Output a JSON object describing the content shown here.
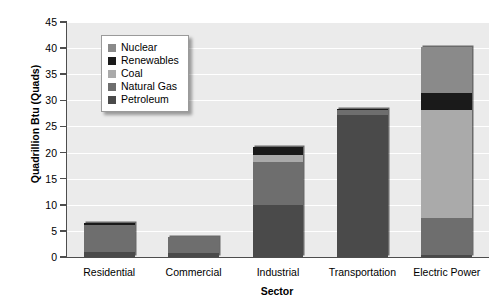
{
  "chart_data": {
    "type": "bar",
    "subtype": "stacked-bar",
    "title": "",
    "xlabel": "Sector",
    "ylabel": "Quadrillion Btu (Quads)",
    "ylim": [
      0,
      45
    ],
    "ytick_step": 5,
    "yticks": [
      0,
      5,
      10,
      15,
      20,
      25,
      30,
      35,
      40,
      45
    ],
    "grid": "horizontal",
    "legend_position": "upper-left-inside",
    "categories": [
      "Residential",
      "Commercial",
      "Industrial",
      "Transportation",
      "Electric Power"
    ],
    "series": [
      {
        "name": "Petroleum",
        "color": "#4a4a4a",
        "values": [
          1.0,
          0.7,
          9.9,
          27.2,
          0.4
        ]
      },
      {
        "name": "Natural Gas",
        "color": "#6e6e6e",
        "values": [
          5.2,
          3.1,
          8.3,
          0.9,
          7.0
        ]
      },
      {
        "name": "Coal",
        "color": "#aaaaaa",
        "values": [
          0.0,
          0.0,
          1.3,
          0.0,
          20.8
        ]
      },
      {
        "name": "Renewables",
        "color": "#1a1a1a",
        "values": [
          0.3,
          0.0,
          1.5,
          0.3,
          3.3
        ]
      },
      {
        "name": "Nuclear",
        "color": "#8a8a8a",
        "values": [
          0.0,
          0.0,
          0.0,
          0.0,
          8.8
        ]
      }
    ],
    "totals": [
      6.5,
      3.8,
      21.0,
      28.4,
      40.3
    ]
  },
  "legend": {
    "items": [
      {
        "label": "Nuclear",
        "color": "#8a8a8a"
      },
      {
        "label": "Renewables",
        "color": "#1a1a1a"
      },
      {
        "label": "Coal",
        "color": "#aaaaaa"
      },
      {
        "label": "Natural Gas",
        "color": "#6e6e6e"
      },
      {
        "label": "Petroleum",
        "color": "#4a4a4a"
      }
    ]
  },
  "axes": {
    "y_title": "Quadrillion Btu (Quads)",
    "x_title": "Sector",
    "y_tick_labels": [
      "45",
      "40",
      "35",
      "30",
      "25",
      "20",
      "15",
      "10",
      "5",
      "0"
    ]
  },
  "colors": {
    "plot_background": "#ebebeb",
    "gridline": "#ffffff",
    "axis": "#4d4d4d",
    "page_background": "#ffffff"
  }
}
